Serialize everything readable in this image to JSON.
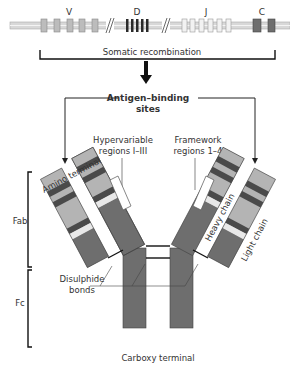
{
  "gene_segments": {
    "labels": {
      "v": "V",
      "d": "D",
      "j": "J",
      "c": "C"
    },
    "bracket_label": "Somatic recombination"
  },
  "antigen_binding": {
    "line1": "Antigen–binding",
    "line2": "sites"
  },
  "annotations": {
    "hypervariable": {
      "line1": "Hypervariable",
      "line2": "regions I–III"
    },
    "framework": {
      "line1": "Framework",
      "line2": "regions 1–4"
    },
    "amino_terminal": "Amino terminal",
    "heavy_chain": "Heavy chain",
    "light_chain": "Light chain",
    "disulphide": {
      "line1": "Disulphide",
      "line2": "bonds"
    },
    "carboxy_terminal": "Carboxy terminal"
  },
  "brackets": {
    "fab": "Fab",
    "fc": "Fc"
  },
  "colors": {
    "constant": "#6e6e6e",
    "variable": "#b4b4b4",
    "hypervariable": "#4a4a4a",
    "light_band": "#e8e8e8",
    "d_segment": "#2a2a2a",
    "j_segment": "#f2f2f2",
    "dna_line": "#c8c8c8"
  }
}
